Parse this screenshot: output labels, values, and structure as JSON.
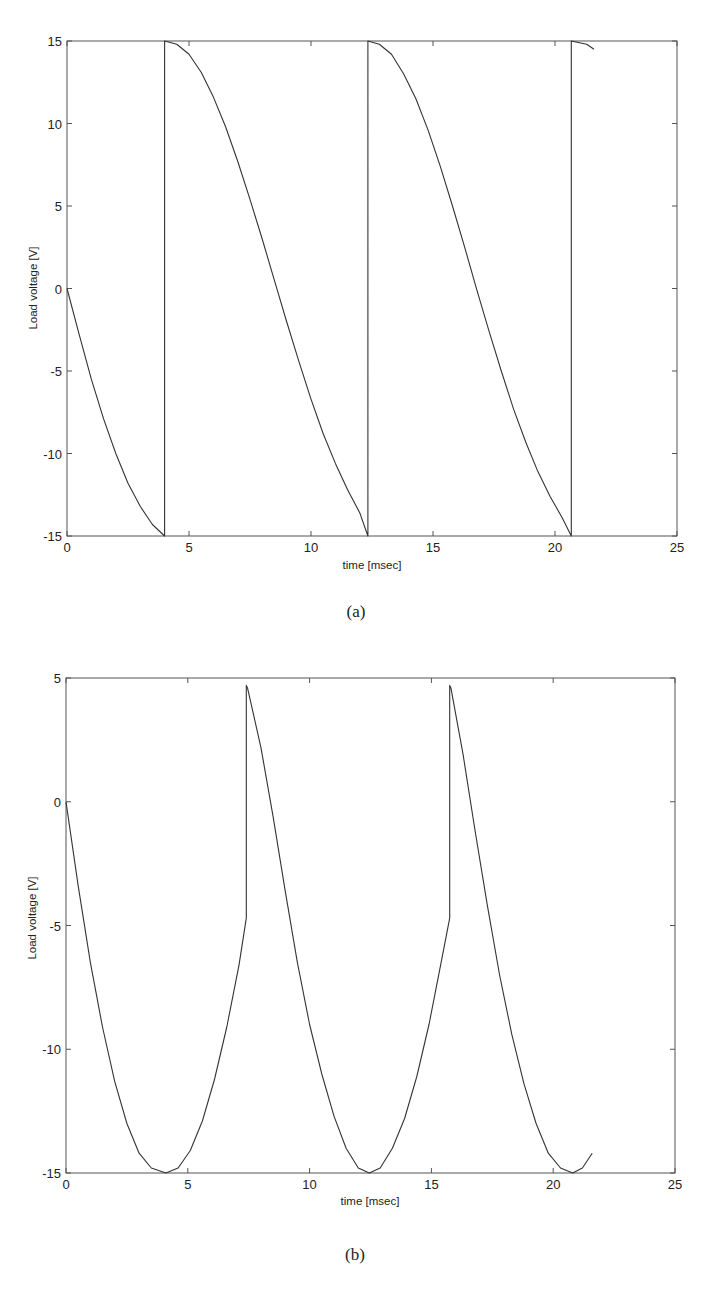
{
  "chart_data": [
    {
      "id": "a",
      "type": "line",
      "caption": "(a)",
      "title": "",
      "xlabel": "time [msec]",
      "ylabel": "Load voltage [V]",
      "xlim": [
        0,
        25
      ],
      "ylim": [
        -15,
        15
      ],
      "xticks": [
        0,
        5,
        10,
        15,
        20,
        25
      ],
      "yticks": [
        -15,
        -10,
        -5,
        0,
        5,
        10,
        15
      ],
      "grid": false,
      "legend": "none",
      "series": [
        {
          "name": "load voltage",
          "color": "#333333",
          "x": [
            0,
            0.5,
            1,
            1.5,
            2,
            2.5,
            3,
            3.5,
            4.0,
            4.0,
            4.5,
            5,
            5.5,
            6,
            6.5,
            7,
            7.5,
            8,
            8.5,
            9,
            9.5,
            10,
            10.5,
            11,
            11.5,
            12,
            12.33,
            12.33,
            12.8,
            13.3,
            13.8,
            14.3,
            14.8,
            15.3,
            15.8,
            16.3,
            16.8,
            17.3,
            17.8,
            18.3,
            18.8,
            19.3,
            19.8,
            20.3,
            20.67,
            20.67,
            21.0,
            21.3,
            21.6
          ],
          "y": [
            0,
            -2.8,
            -5.5,
            -7.9,
            -10.0,
            -11.8,
            -13.2,
            -14.3,
            -15.0,
            15.0,
            14.8,
            14.2,
            13.1,
            11.6,
            9.8,
            7.7,
            5.4,
            3.0,
            0.5,
            -2.0,
            -4.4,
            -6.7,
            -8.8,
            -10.6,
            -12.2,
            -13.6,
            -15.0,
            15.0,
            14.8,
            14.2,
            13.0,
            11.5,
            9.6,
            7.4,
            5.0,
            2.5,
            -0.1,
            -2.6,
            -5.0,
            -7.3,
            -9.3,
            -11.1,
            -12.6,
            -13.9,
            -15.0,
            15.0,
            14.9,
            14.8,
            14.5
          ]
        }
      ]
    },
    {
      "id": "b",
      "type": "line",
      "caption": "(b)",
      "title": "",
      "xlabel": "time [msec]",
      "ylabel": "Load voltage [V]",
      "xlim": [
        0,
        25
      ],
      "ylim": [
        -15,
        5
      ],
      "xticks": [
        0,
        5,
        10,
        15,
        20,
        25
      ],
      "yticks": [
        -15,
        -10,
        -5,
        0,
        5
      ],
      "grid": false,
      "legend": "none",
      "series": [
        {
          "name": "load voltage",
          "color": "#333333",
          "x": [
            0,
            0.5,
            1,
            1.5,
            2,
            2.5,
            3,
            3.5,
            4.1,
            4.6,
            5.1,
            5.6,
            6.1,
            6.6,
            7.1,
            7.4,
            7.4,
            7.45,
            8,
            8.5,
            9,
            9.5,
            10,
            10.5,
            11,
            11.5,
            12,
            12.45,
            12.9,
            13.4,
            13.9,
            14.4,
            14.9,
            15.4,
            15.75,
            15.75,
            15.8,
            16.3,
            16.8,
            17.3,
            17.8,
            18.3,
            18.8,
            19.3,
            19.8,
            20.3,
            20.8,
            21.2,
            21.6
          ],
          "y": [
            0,
            -3.4,
            -6.5,
            -9.1,
            -11.3,
            -13.0,
            -14.2,
            -14.8,
            -15.0,
            -14.8,
            -14.1,
            -12.9,
            -11.2,
            -9.1,
            -6.6,
            -4.7,
            4.7,
            4.6,
            2.2,
            -0.6,
            -3.6,
            -6.5,
            -9.0,
            -11.0,
            -12.7,
            -14.0,
            -14.8,
            -15.0,
            -14.8,
            -14.0,
            -12.8,
            -11.1,
            -9.0,
            -6.5,
            -4.7,
            4.7,
            4.6,
            1.9,
            -1.2,
            -4.2,
            -7.0,
            -9.4,
            -11.4,
            -13.0,
            -14.2,
            -14.8,
            -15.0,
            -14.8,
            -14.2
          ]
        }
      ]
    }
  ]
}
